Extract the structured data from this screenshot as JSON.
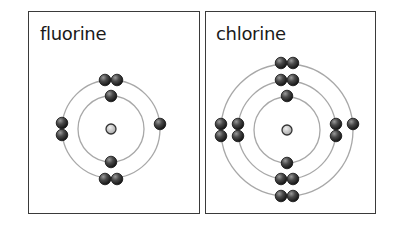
{
  "colors": {
    "shell": "#a8a8a8",
    "electron_dark": "#222222",
    "electron_light": "#8a8a8a",
    "nucleus_fill": "#c8c8c8",
    "nucleus_stroke": "#333333",
    "border": "#3a3a3a"
  },
  "panels": [
    {
      "name": "fluorine",
      "label": "fluorine",
      "box": {
        "x": 28,
        "y": 11,
        "w": 172,
        "h": 203
      },
      "label_pos": {
        "x": 11,
        "y": 11
      },
      "nucleus": {
        "cx": 111,
        "cy": 129,
        "r": 5
      },
      "shells": [
        33,
        49
      ],
      "electrons": [
        {
          "cx": 111,
          "cy": 96
        },
        {
          "cx": 111,
          "cy": 162
        },
        {
          "cx": 105,
          "cy": 80
        },
        {
          "cx": 117,
          "cy": 80
        },
        {
          "cx": 105,
          "cy": 179
        },
        {
          "cx": 117,
          "cy": 179
        },
        {
          "cx": 62,
          "cy": 123
        },
        {
          "cx": 62,
          "cy": 135
        },
        {
          "cx": 160,
          "cy": 124
        }
      ]
    },
    {
      "name": "chlorine",
      "label": "chlorine",
      "box": {
        "x": 205,
        "y": 11,
        "w": 171,
        "h": 203
      },
      "label_pos": {
        "x": 10,
        "y": 11
      },
      "nucleus": {
        "cx": 287,
        "cy": 130,
        "r": 5
      },
      "shells": [
        33,
        49,
        66
      ],
      "electrons": [
        {
          "cx": 287,
          "cy": 96
        },
        {
          "cx": 287,
          "cy": 163
        },
        {
          "cx": 281,
          "cy": 80
        },
        {
          "cx": 293,
          "cy": 80
        },
        {
          "cx": 281,
          "cy": 179
        },
        {
          "cx": 293,
          "cy": 179
        },
        {
          "cx": 238,
          "cy": 124
        },
        {
          "cx": 238,
          "cy": 136
        },
        {
          "cx": 336,
          "cy": 124
        },
        {
          "cx": 336,
          "cy": 136
        },
        {
          "cx": 281,
          "cy": 63
        },
        {
          "cx": 293,
          "cy": 63
        },
        {
          "cx": 281,
          "cy": 196
        },
        {
          "cx": 293,
          "cy": 196
        },
        {
          "cx": 221,
          "cy": 124
        },
        {
          "cx": 221,
          "cy": 136
        },
        {
          "cx": 353,
          "cy": 124
        }
      ]
    }
  ]
}
